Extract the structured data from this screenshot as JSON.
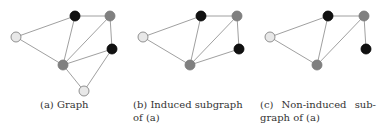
{
  "figure": {
    "subfigures": [
      {
        "id": "a",
        "caption": "(a) Graph",
        "nodes": [
          {
            "id": "L",
            "x": 16,
            "y": 37,
            "color": "light"
          },
          {
            "id": "T",
            "x": 75,
            "y": 16,
            "color": "black"
          },
          {
            "id": "TR",
            "x": 110,
            "y": 16,
            "color": "gray"
          },
          {
            "id": "R",
            "x": 112,
            "y": 49,
            "color": "black"
          },
          {
            "id": "M",
            "x": 63,
            "y": 65,
            "color": "gray"
          },
          {
            "id": "B",
            "x": 84,
            "y": 91,
            "color": "light"
          }
        ],
        "edges": [
          [
            "L",
            "T"
          ],
          [
            "L",
            "M"
          ],
          [
            "T",
            "TR"
          ],
          [
            "T",
            "M"
          ],
          [
            "TR",
            "M"
          ],
          [
            "TR",
            "R"
          ],
          [
            "R",
            "M"
          ],
          [
            "M",
            "B"
          ],
          [
            "R",
            "B"
          ]
        ]
      },
      {
        "id": "b",
        "caption": "(b) Induced subgraph of (a)",
        "nodes": [
          {
            "id": "L",
            "x": 143,
            "y": 37,
            "color": "light"
          },
          {
            "id": "T",
            "x": 201,
            "y": 16,
            "color": "black"
          },
          {
            "id": "TR",
            "x": 237,
            "y": 16,
            "color": "gray"
          },
          {
            "id": "R",
            "x": 239,
            "y": 49,
            "color": "black"
          },
          {
            "id": "M",
            "x": 190,
            "y": 65,
            "color": "gray"
          }
        ],
        "edges": [
          [
            "L",
            "T"
          ],
          [
            "L",
            "M"
          ],
          [
            "T",
            "TR"
          ],
          [
            "T",
            "M"
          ],
          [
            "TR",
            "M"
          ],
          [
            "TR",
            "R"
          ],
          [
            "R",
            "M"
          ]
        ]
      },
      {
        "id": "c",
        "caption": "(c) Non-induced sub-graph of (a)",
        "nodes": [
          {
            "id": "L",
            "x": 270,
            "y": 37,
            "color": "light"
          },
          {
            "id": "T",
            "x": 328,
            "y": 16,
            "color": "black"
          },
          {
            "id": "TR",
            "x": 364,
            "y": 16,
            "color": "gray"
          },
          {
            "id": "R",
            "x": 366,
            "y": 49,
            "color": "black"
          },
          {
            "id": "M",
            "x": 317,
            "y": 65,
            "color": "gray"
          }
        ],
        "edges": [
          [
            "L",
            "T"
          ],
          [
            "L",
            "M"
          ],
          [
            "T",
            "TR"
          ],
          [
            "T",
            "M"
          ],
          [
            "TR",
            "M"
          ],
          [
            "TR",
            "R"
          ]
        ]
      }
    ],
    "colors": {
      "light": "#e8e8e8",
      "gray": "#808080",
      "black": "#111111",
      "edge": "#a0a0a0",
      "stroke": "#777777"
    }
  }
}
